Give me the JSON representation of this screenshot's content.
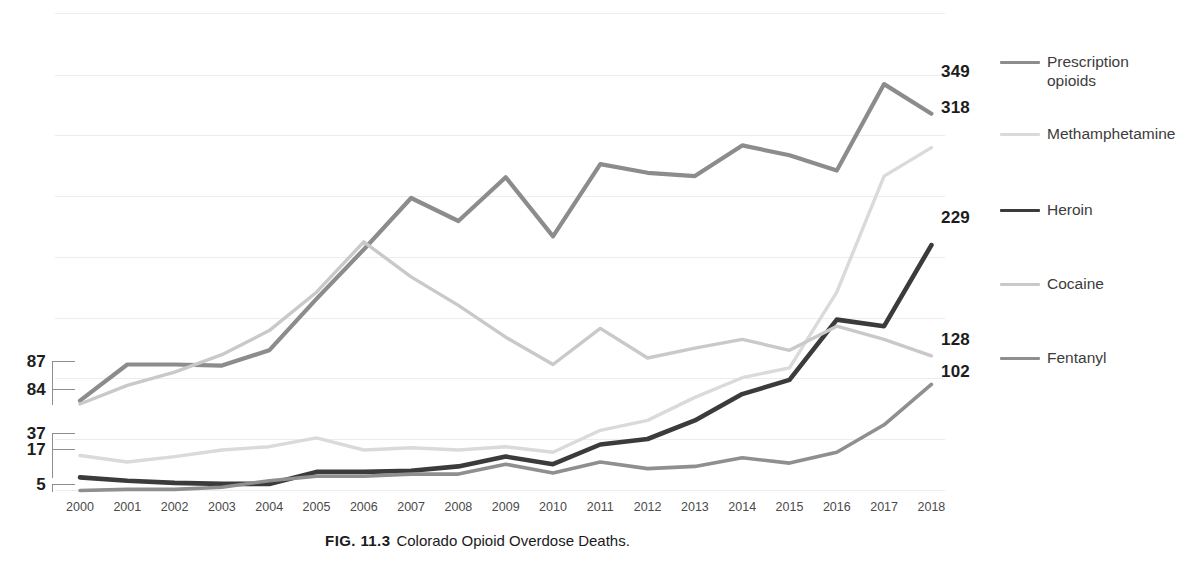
{
  "caption": {
    "figure_number": "FIG. 11.3",
    "text": "Colorado Opioid Overdose Deaths."
  },
  "legend": {
    "position": "right",
    "items": [
      {
        "label": "Prescription\nopioids",
        "color": "#8c8c8c",
        "key": "prescription-opioids"
      },
      {
        "label": "Methamphetamine",
        "color": "#dadada",
        "key": "methamphetamine"
      },
      {
        "label": "Heroin",
        "color": "#3b3b3b",
        "key": "heroin"
      },
      {
        "label": "Cocaine",
        "color": "#c9c9c9",
        "key": "cocaine"
      },
      {
        "label": "Fentanyl",
        "color": "#8f8f8f",
        "key": "fentanyl"
      }
    ]
  },
  "start_labels": [
    {
      "value": "87",
      "series": "prescription-opioids"
    },
    {
      "value": "84",
      "series": "cocaine"
    },
    {
      "value": "37",
      "series": "methamphetamine"
    },
    {
      "value": "17",
      "series": "heroin"
    },
    {
      "value": "5",
      "series": "fentanyl"
    }
  ],
  "end_labels": [
    {
      "value": "349",
      "series": "prescription-opioids"
    },
    {
      "value": "318",
      "series": "methamphetamine"
    },
    {
      "value": "229",
      "series": "heroin"
    },
    {
      "value": "128",
      "series": "cocaine"
    },
    {
      "value": "102",
      "series": "fentanyl"
    }
  ],
  "chart_data": {
    "type": "line",
    "title": "Colorado Opioid Overdose Deaths.",
    "xlabel": "",
    "ylabel": "",
    "grid": true,
    "legend_position": "right",
    "ylim": [
      0,
      400
    ],
    "x": [
      2000,
      2001,
      2002,
      2003,
      2004,
      2005,
      2006,
      2007,
      2008,
      2009,
      2010,
      2011,
      2012,
      2013,
      2014,
      2015,
      2016,
      2017,
      2018
    ],
    "categories": [
      "2000",
      "2001",
      "2002",
      "2003",
      "2004",
      "2005",
      "2006",
      "2007",
      "2008",
      "2009",
      "2010",
      "2011",
      "2012",
      "2013",
      "2014",
      "2015",
      "2016",
      "2017",
      "2018"
    ],
    "series": [
      {
        "name": "Prescription opioids",
        "color": "#8c8c8c",
        "values": [
          87,
          120,
          120,
          119,
          133,
          180,
          225,
          272,
          251,
          291,
          237,
          303,
          295,
          292,
          320,
          311,
          297,
          376,
          349
        ]
      },
      {
        "name": "Methamphetamine",
        "color": "#dadada",
        "values": [
          37,
          31,
          36,
          42,
          45,
          53,
          42,
          44,
          42,
          45,
          40,
          60,
          69,
          90,
          108,
          117,
          186,
          292,
          318
        ]
      },
      {
        "name": "Heroin",
        "color": "#3b3b3b",
        "values": [
          17,
          14,
          12,
          11,
          11,
          22,
          22,
          23,
          27,
          36,
          29,
          47,
          52,
          69,
          93,
          106,
          161,
          155,
          229
        ]
      },
      {
        "name": "Cocaine",
        "color": "#c9c9c9",
        "values": [
          84,
          101,
          113,
          129,
          151,
          186,
          232,
          200,
          174,
          145,
          120,
          153,
          126,
          135,
          143,
          133,
          155,
          143,
          128
        ]
      },
      {
        "name": "Fentanyl",
        "color": "#8f8f8f",
        "values": [
          5,
          6,
          6,
          8,
          14,
          18,
          18,
          20,
          20,
          29,
          21,
          31,
          25,
          27,
          35,
          30,
          40,
          65,
          102
        ]
      }
    ]
  }
}
